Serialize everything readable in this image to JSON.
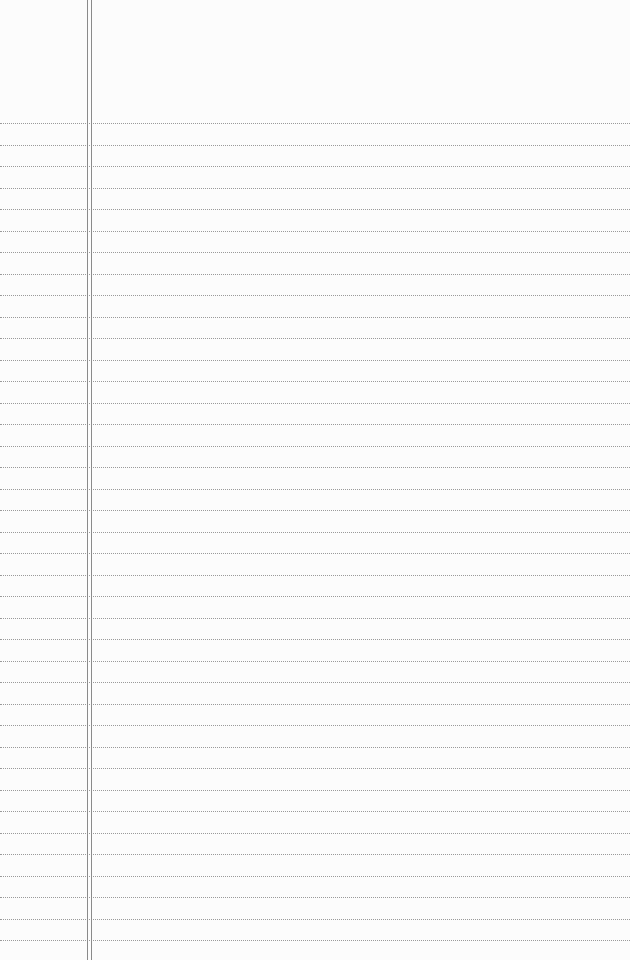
{
  "paper": {
    "background": "#fcfcfc",
    "rule_color": "#9a9a9a",
    "margin_color": "#8a8a8a",
    "first_rule_y": 123,
    "rule_spacing": 21.5,
    "rule_count": 39,
    "margin_lines_x": [
      87,
      91
    ]
  }
}
